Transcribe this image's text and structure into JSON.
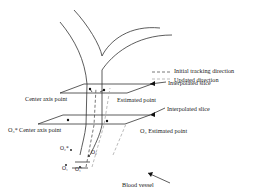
{
  "diagram": {
    "legend": [
      {
        "label": "Initial tracking direction",
        "style": "dashed-dark"
      },
      {
        "label": "Updated direction",
        "style": "dashed-light"
      }
    ],
    "labels": {
      "interpolated_slice_top": "Interpolated slice",
      "interpolated_slice_mid": "Interpolated slice",
      "center_axis_point_top": "Center axis point",
      "estimated_point_top": "Estimated point",
      "center_axis_point_mid": "Center axis point",
      "o3_prefix": "O₃*",
      "o3_estimated": "O₃ Estimated point",
      "o2_star": "O₂*",
      "o2": "O₂",
      "o1": "O₁",
      "o1_prime": "O₁'",
      "blood_vessel": "Blood vessel"
    },
    "colors": {
      "line": "#333333",
      "dash_dark": "#555555",
      "dash_light": "#aaaaaa"
    }
  }
}
